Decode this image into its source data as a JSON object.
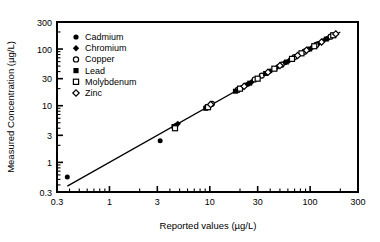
{
  "chart_data": {
    "type": "scatter",
    "title": "",
    "xlabel": "Reported values (µg/L)",
    "ylabel": "Measured Concentration (µg/L)",
    "xscale": "log",
    "yscale": "log",
    "xlim": [
      0.3,
      300
    ],
    "ylim": [
      0.3,
      300
    ],
    "xticks": [
      0.3,
      1,
      3,
      10,
      30,
      100,
      300
    ],
    "xticklabels": [
      "0.3",
      "1",
      "3",
      "10",
      "30",
      "100",
      "300"
    ],
    "yticks": [
      0.3,
      1,
      3,
      10,
      30,
      100,
      300
    ],
    "yticklabels": [
      "0.3",
      "1",
      "3",
      "10",
      "30",
      "100",
      "300"
    ],
    "grid": false,
    "legend_position": "upper-left-inside",
    "reference_line": {
      "label": "1:1 line",
      "x": [
        0.38,
        200
      ],
      "y": [
        0.38,
        200
      ],
      "color": "#000000"
    },
    "series": [
      {
        "name": "Cadmium",
        "marker": "filled-circle",
        "color": "#000000",
        "points": [
          [
            0.38,
            0.55
          ],
          [
            3.2,
            2.4
          ],
          [
            4.6,
            4.5
          ],
          [
            9.3,
            9.6
          ],
          [
            21,
            21
          ],
          [
            24,
            24
          ],
          [
            40,
            41
          ],
          [
            56,
            57
          ],
          [
            95,
            97
          ],
          [
            120,
            125
          ],
          [
            150,
            155
          ]
        ]
      },
      {
        "name": "Chromium",
        "marker": "filled-diamond",
        "color": "#000000",
        "points": [
          [
            4.8,
            4.8
          ],
          [
            9.8,
            10
          ],
          [
            23,
            23
          ],
          [
            26,
            26
          ],
          [
            47,
            48
          ],
          [
            62,
            63
          ],
          [
            105,
            108
          ],
          [
            135,
            140
          ]
        ]
      },
      {
        "name": "Copper",
        "marker": "open-circle",
        "color": "#000000",
        "points": [
          [
            10.5,
            10.8
          ],
          [
            19,
            19
          ],
          [
            28,
            29
          ],
          [
            33,
            34
          ],
          [
            52,
            53
          ],
          [
            70,
            72
          ],
          [
            88,
            90
          ],
          [
            115,
            118
          ],
          [
            160,
            165
          ]
        ]
      },
      {
        "name": "Lead",
        "marker": "filled-square",
        "color": "#000000",
        "points": [
          [
            4.4,
            4.3
          ],
          [
            9.1,
            9.0
          ],
          [
            18,
            18
          ],
          [
            25,
            25
          ],
          [
            36,
            37
          ],
          [
            58,
            59
          ],
          [
            99,
            100
          ],
          [
            145,
            150
          ]
        ]
      },
      {
        "name": "Molybdenum",
        "marker": "open-square",
        "color": "#000000",
        "points": [
          [
            4.5,
            4.0
          ],
          [
            9.6,
            9.4
          ],
          [
            20,
            20
          ],
          [
            30,
            30
          ],
          [
            44,
            45
          ],
          [
            66,
            67
          ],
          [
            82,
            84
          ],
          [
            110,
            112
          ],
          [
            170,
            175
          ]
        ]
      },
      {
        "name": "Zinc",
        "marker": "open-diamond",
        "color": "#000000",
        "points": [
          [
            10.2,
            10.5
          ],
          [
            22,
            22
          ],
          [
            38,
            39
          ],
          [
            50,
            51
          ],
          [
            75,
            77
          ],
          [
            92,
            95
          ],
          [
            130,
            133
          ],
          [
            180,
            185
          ]
        ]
      }
    ],
    "legend": [
      {
        "label": "Cadmium",
        "marker": "filled-circle"
      },
      {
        "label": "Chromium",
        "marker": "filled-diamond"
      },
      {
        "label": "Copper",
        "marker": "open-circle"
      },
      {
        "label": "Lead",
        "marker": "filled-square"
      },
      {
        "label": "Molybdenum",
        "marker": "open-square"
      },
      {
        "label": "Zinc",
        "marker": "open-diamond"
      }
    ]
  }
}
